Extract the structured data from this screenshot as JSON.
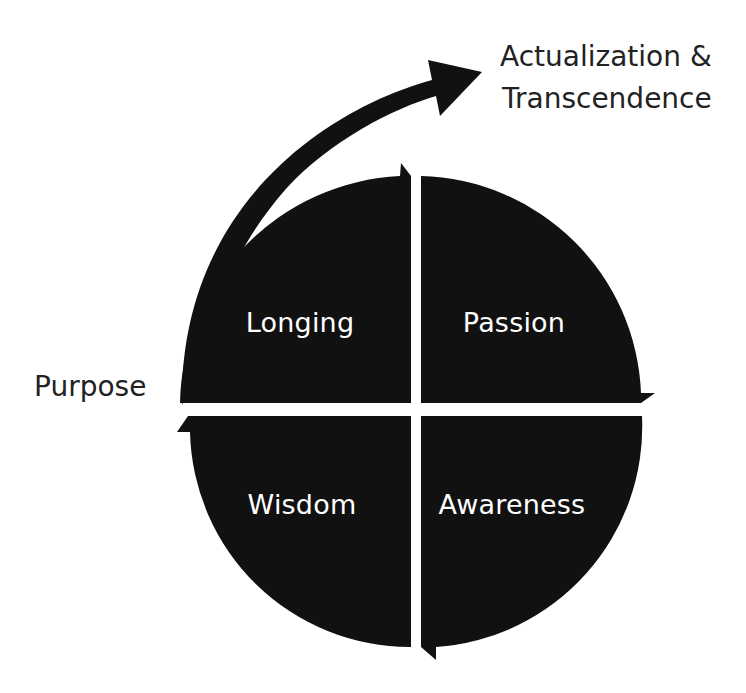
{
  "diagram": {
    "type": "cycle-quadrant",
    "fill_color": "#111111",
    "text_color_inner": "#ffffff",
    "text_color_outer": "#222222",
    "quadrants": [
      {
        "position": "top-left",
        "label": "Longing"
      },
      {
        "position": "top-right",
        "label": "Passion"
      },
      {
        "position": "bottom-right",
        "label": "Awareness"
      },
      {
        "position": "bottom-left",
        "label": "Wisdom"
      }
    ],
    "outer_labels": {
      "left": "Purpose",
      "top_right_line1": "Actualization &",
      "top_right_line2": "Transcendence"
    },
    "flow_direction": "clockwise",
    "exit_arrow": "curved arrow from Purpose up toward Actualization & Transcendence"
  }
}
